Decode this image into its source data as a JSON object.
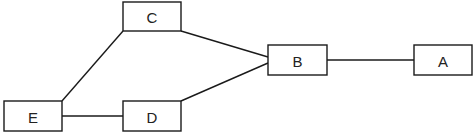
{
  "diagram": {
    "type": "graph",
    "nodes": {
      "A": {
        "label": "A",
        "x": 414,
        "y": 45,
        "w": 58,
        "h": 30
      },
      "B": {
        "label": "B",
        "x": 268,
        "y": 45,
        "w": 59,
        "h": 30
      },
      "C": {
        "label": "C",
        "x": 123,
        "y": 2,
        "w": 58,
        "h": 29
      },
      "D": {
        "label": "D",
        "x": 123,
        "y": 101,
        "w": 58,
        "h": 30
      },
      "E": {
        "label": "E",
        "x": 4,
        "y": 101,
        "w": 58,
        "h": 30
      }
    },
    "edges": [
      {
        "from": "C",
        "to": "E",
        "x1": 123,
        "y1": 31,
        "x2": 62,
        "y2": 101
      },
      {
        "from": "C",
        "to": "B",
        "x1": 181,
        "y1": 31,
        "x2": 268,
        "y2": 57
      },
      {
        "from": "D",
        "to": "B",
        "x1": 181,
        "y1": 101,
        "x2": 268,
        "y2": 63
      },
      {
        "from": "E",
        "to": "D",
        "x1": 62,
        "y1": 116,
        "x2": 123,
        "y2": 116
      },
      {
        "from": "B",
        "to": "A",
        "x1": 327,
        "y1": 60,
        "x2": 414,
        "y2": 60
      }
    ],
    "colors": {
      "stroke": "#1a1a1a",
      "fill": "#ffffff",
      "text": "#222222"
    }
  }
}
